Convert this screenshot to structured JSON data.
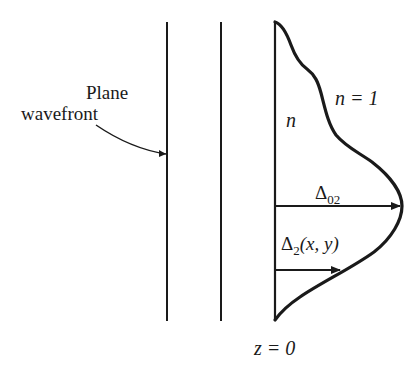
{
  "diagram": {
    "labels": {
      "plane_line1": "Plane",
      "plane_line2": "wavefront",
      "n_inside": "n",
      "n_outside": "n = 1",
      "delta02_symbol": "Δ",
      "delta02_sub": "02",
      "delta2_symbol": "Δ",
      "delta2_sub": "2",
      "delta2_args": "(x, y)",
      "z0": "z = 0"
    },
    "colors": {
      "stroke": "#1a1a1a",
      "background": "#ffffff"
    }
  }
}
